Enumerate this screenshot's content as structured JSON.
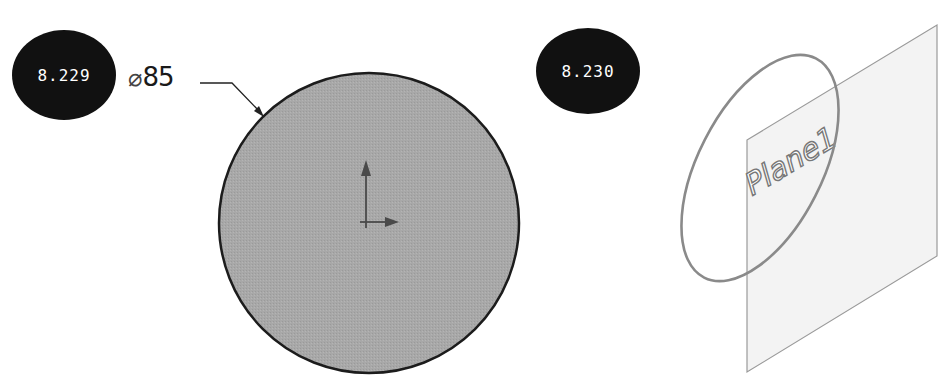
{
  "figures": [
    {
      "id": "8.229",
      "badge_label": "8.229",
      "dimension": {
        "symbol": "⌀",
        "value": "85",
        "full": "⌀85"
      },
      "shape": "filled circle sketch",
      "fill_color": "#a9a9a9",
      "outline_color": "#1a1a1a",
      "origin_marker": "origin-axes-icon"
    },
    {
      "id": "8.230",
      "badge_label": "8.230",
      "plane_label": "Plane1",
      "shape": "ellipse intersecting plane (isometric)",
      "plane_fill": "#f2f2f2",
      "line_color": "#8a8a8a"
    }
  ],
  "colors": {
    "badge_bg": "#111111",
    "badge_text": "#ffffff",
    "background": "#ffffff"
  }
}
